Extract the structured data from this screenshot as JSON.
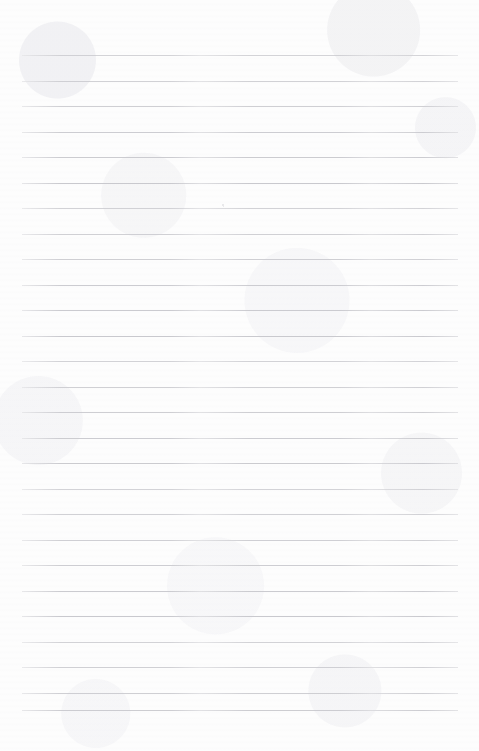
{
  "page": {
    "kind": "scanned-blank-lined-notebook-page",
    "width": 479,
    "height": 751,
    "background_color": "#fdfdfd",
    "has_text_content": false,
    "text_content": "",
    "orientation": "portrait"
  },
  "ruling": {
    "line_color": "#c9c9ce",
    "line_thickness_px": 1,
    "line_count": 27,
    "left_x": 22,
    "right_x": 458,
    "line_length_px": 436,
    "first_line_y": 55,
    "last_line_y": 710,
    "spacing_px": 25.5,
    "line_y_positions": [
      55,
      81,
      106,
      132,
      157,
      183,
      208,
      234,
      259,
      285,
      310,
      336,
      361,
      387,
      412,
      438,
      463,
      489,
      514,
      540,
      565,
      591,
      616,
      642,
      667,
      693,
      710
    ]
  },
  "margins": {
    "top_margin_px": 55,
    "bottom_margin_px": 41,
    "left_margin_px": 22,
    "right_margin_px": 21,
    "top_label": "",
    "bottom_label": ""
  },
  "artifacts": {
    "specks": [
      {
        "x": 222,
        "y": 204,
        "size": 2,
        "color": "#d9d9dd"
      },
      {
        "x": 223,
        "y": 206,
        "size": 1,
        "color": "#dcdce0"
      }
    ],
    "texture_note": ""
  }
}
